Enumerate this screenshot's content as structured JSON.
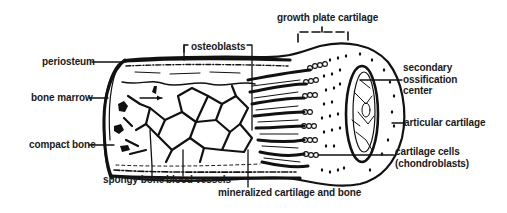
{
  "figure": {
    "type": "anatomical illustration",
    "colors": {
      "ink": "#111111",
      "background": "#ffffff"
    }
  },
  "labels": {
    "growth_plate_cartilage": "growth plate cartilage",
    "osteoblasts": "osteoblasts",
    "periosteum": "periosteum",
    "bone_marrow": "bone marrow",
    "compact_bone": "compact bone",
    "spongy_bone": "spongy bone",
    "blood_vessels": "blood vessels",
    "mineralized_cartilage_and_bone": "mineralized cartilage and bone",
    "secondary_ossification_center": "secondary\nossification\ncenter",
    "articular_cartilage": "articular cartilage",
    "cartilage_cells": "cartilage cells\n(chondroblasts)"
  }
}
